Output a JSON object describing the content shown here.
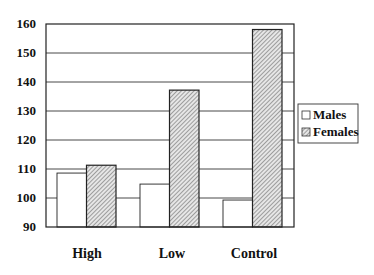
{
  "chart_data": {
    "type": "bar",
    "title": "",
    "xlabel": "",
    "ylabel": "",
    "categories": [
      "High",
      "Low",
      "Control"
    ],
    "series": [
      {
        "name": "Males",
        "values": [
          108.6,
          104.8,
          99.3
        ],
        "fill": "#ffffff",
        "pattern": "none"
      },
      {
        "name": "Females",
        "values": [
          111.3,
          137.2,
          158.1
        ],
        "fill": "#d8d8d8",
        "pattern": "diagonal-hatch"
      }
    ],
    "ylim": [
      90,
      160
    ],
    "yticks": [
      90,
      100,
      110,
      120,
      130,
      140,
      150,
      160
    ],
    "ytick_labels": [
      "90",
      "100",
      "110",
      "120",
      "130",
      "140",
      "150",
      "160"
    ],
    "grid": "horizontal",
    "legend": {
      "position": "right",
      "entries": [
        "Males",
        "Females"
      ]
    }
  }
}
